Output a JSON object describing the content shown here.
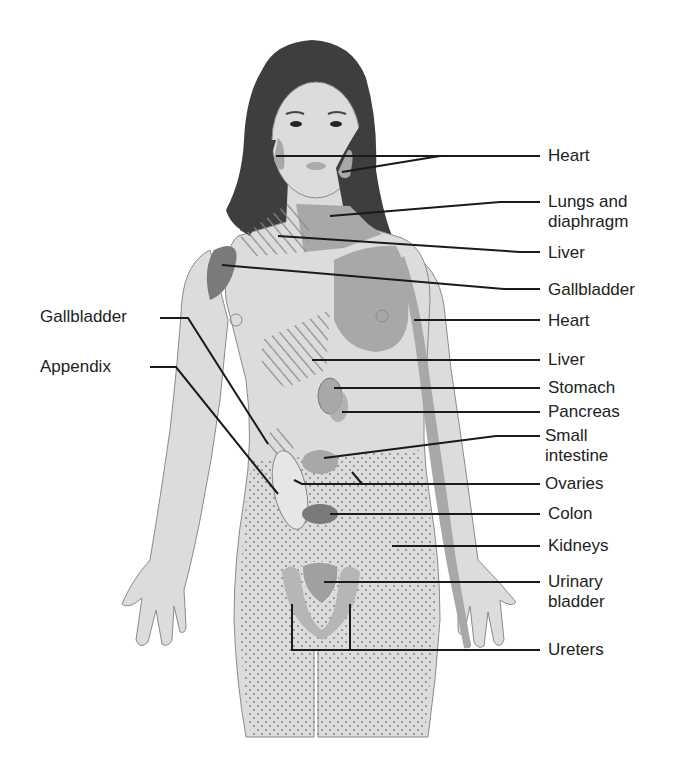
{
  "figure": {
    "colors": {
      "skin": "#dcdcdc",
      "skin_outline": "#8a8a8a",
      "hair": "#3c3c3c",
      "organ_mid": "#a8a8a8",
      "organ_dark": "#7a7a7a",
      "hatch": "#888888",
      "leader": "#1a1a1a",
      "text": "#222222"
    }
  },
  "labels_right": [
    {
      "id": "heart-1",
      "text": "Heart",
      "x": 548,
      "y": 146
    },
    {
      "id": "lungs-diaphragm",
      "text": "Lungs and\ndiaphragm",
      "x": 548,
      "y": 192
    },
    {
      "id": "liver-1",
      "text": "Liver",
      "x": 548,
      "y": 243
    },
    {
      "id": "gallbladder-1",
      "text": "Gallbladder",
      "x": 548,
      "y": 280
    },
    {
      "id": "heart-2",
      "text": "Heart",
      "x": 548,
      "y": 313
    },
    {
      "id": "liver-2",
      "text": "Liver",
      "x": 548,
      "y": 352
    },
    {
      "id": "stomach",
      "text": "Stomach",
      "x": 548,
      "y": 380
    },
    {
      "id": "pancreas",
      "text": "Pancreas",
      "x": 548,
      "y": 403
    },
    {
      "id": "small-intestine",
      "text": "Small\nintestine",
      "x": 545,
      "y": 427
    },
    {
      "id": "ovaries",
      "text": "Ovaries",
      "x": 545,
      "y": 477
    },
    {
      "id": "colon",
      "text": "Colon",
      "x": 548,
      "y": 506
    },
    {
      "id": "kidneys",
      "text": "Kidneys",
      "x": 548,
      "y": 537
    },
    {
      "id": "urinary-bladder",
      "text": "Urinary\nbladder",
      "x": 548,
      "y": 573
    },
    {
      "id": "ureters",
      "text": "Ureters",
      "x": 548,
      "y": 638
    }
  ],
  "labels_left": [
    {
      "id": "gallbladder-left",
      "text": "Gallbladder",
      "x": 40,
      "y": 304
    },
    {
      "id": "appendix",
      "text": "Appendix",
      "x": 40,
      "y": 354
    }
  ]
}
